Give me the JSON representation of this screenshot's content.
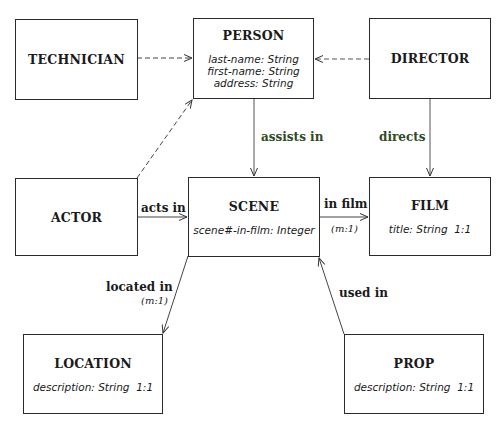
{
  "entities": {
    "technician": {
      "name": "TECHNICIAN"
    },
    "person": {
      "name": "PERSON",
      "attributes": [
        "last-name: String",
        "first-name: String",
        "address: String"
      ]
    },
    "director": {
      "name": "DIRECTOR"
    },
    "actor": {
      "name": "ACTOR"
    },
    "scene": {
      "name": "SCENE",
      "attributes": [
        "scene#-in-film: Integer"
      ]
    },
    "film": {
      "name": "FILM",
      "attributes": [
        "title: String  1:1"
      ]
    },
    "location": {
      "name": "LOCATION",
      "attributes": [
        "description: String  1:1"
      ]
    },
    "prop": {
      "name": "PROP",
      "attributes": [
        "description: String  1:1"
      ]
    }
  },
  "relationships": {
    "assists_in": {
      "label": "assists in",
      "color": "#2f4a24"
    },
    "directs": {
      "label": "directs",
      "color": "#2f4a24"
    },
    "acts_in": {
      "label": "acts in"
    },
    "in_film": {
      "label": "in film",
      "cardinality": "(m:1)"
    },
    "located_in": {
      "label": "located in",
      "cardinality": "(m:1)"
    },
    "used_in": {
      "label": "used in"
    }
  }
}
